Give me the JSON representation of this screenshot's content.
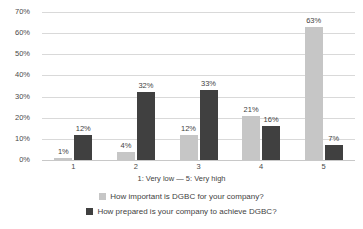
{
  "chart_data": {
    "type": "bar",
    "title": "",
    "xlabel": "1: Very low — 5: Very high",
    "ylabel": "",
    "categories": [
      "1",
      "2",
      "3",
      "4",
      "5"
    ],
    "ylim": [
      0,
      70
    ],
    "ytick_labels": [
      "0%",
      "10%",
      "20%",
      "30%",
      "40%",
      "50%",
      "60%",
      "70%"
    ],
    "ytick_values": [
      0,
      10,
      20,
      30,
      40,
      50,
      60,
      70
    ],
    "grid": true,
    "legend_position": "bottom",
    "series": [
      {
        "name": "How important is DGBC for your company?",
        "color": "#c6c6c6",
        "values": [
          1,
          4,
          12,
          21,
          63
        ],
        "labels": [
          "1%",
          "4%",
          "12%",
          "21%",
          "63%"
        ]
      },
      {
        "name": "How prepared is your company to achieve DGBC?",
        "color": "#404040",
        "values": [
          12,
          32,
          33,
          16,
          7
        ],
        "labels": [
          "12%",
          "32%",
          "33%",
          "16%",
          "7%"
        ]
      }
    ]
  }
}
